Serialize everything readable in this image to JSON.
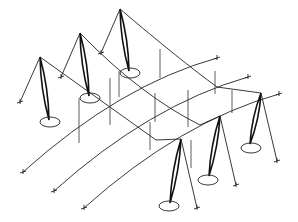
{
  "diagram": {
    "type": "cable-net tensile structure (isometric line drawing)",
    "stroke_color": "#222222",
    "background": "#ffffff",
    "masts": [
      {
        "id": "A",
        "tip": [
          40,
          57
        ],
        "foot": [
          49,
          120
        ],
        "base": [
          50,
          122,
          10,
          5
        ],
        "backstay": [
          20,
          102
        ],
        "forestay_mid": [
          61,
          77
        ]
      },
      {
        "id": "B",
        "tip": [
          80,
          33
        ],
        "foot": [
          89,
          96
        ],
        "base": [
          90,
          98,
          10,
          5
        ],
        "backstay": [
          61,
          77
        ],
        "forestay_mid": [
          101,
          53
        ]
      },
      {
        "id": "C",
        "tip": [
          120,
          9
        ],
        "foot": [
          129,
          71
        ],
        "base": [
          130,
          73,
          10,
          5
        ],
        "backstay": [
          101,
          53
        ]
      },
      {
        "id": "D",
        "tip": [
          181,
          139
        ],
        "foot": [
          170,
          203
        ],
        "base": [
          169,
          206,
          10,
          5
        ],
        "backstay": [
          197,
          208
        ]
      },
      {
        "id": "E",
        "tip": [
          220,
          116
        ],
        "foot": [
          209,
          176
        ],
        "base": [
          208,
          180,
          10,
          5
        ],
        "backstay": [
          236,
          185
        ]
      },
      {
        "id": "F",
        "tip": [
          261,
          93
        ],
        "foot": [
          250,
          144
        ],
        "base": [
          251,
          148,
          10,
          5
        ],
        "backstay": [
          277,
          161
        ]
      }
    ],
    "ridge_cables": [
      {
        "d": "M40 57 L156 140 L181 139"
      },
      {
        "d": "M80 33 Q140 95 200 125 L220 116"
      },
      {
        "d": "M120 9 Q180 60 217 87 L261 93"
      }
    ],
    "valley_cables": [
      {
        "d": "M23 172 Q120 85 217 58",
        "anchor": [
          217,
          58
        ]
      },
      {
        "d": "M54 191 Q150 105 248 77",
        "anchor": [
          248,
          77
        ]
      },
      {
        "d": "M84 208 Q180 122 279 94",
        "anchor": [
          279,
          94
        ]
      }
    ],
    "hangers": [
      {
        "x": 79,
        "y1": 98,
        "y2": 143
      },
      {
        "x": 110,
        "y1": 78,
        "y2": 125
      },
      {
        "x": 119,
        "y1": 71,
        "y2": 97
      },
      {
        "x": 160,
        "y1": 49,
        "y2": 78
      },
      {
        "x": 150,
        "y1": 122,
        "y2": 150
      },
      {
        "x": 188,
        "y1": 90,
        "y2": 127
      },
      {
        "x": 191,
        "y1": 140,
        "y2": 168
      },
      {
        "x": 215,
        "y1": 71,
        "y2": 94
      },
      {
        "x": 232,
        "y1": 90,
        "y2": 113
      },
      {
        "x": 155,
        "y1": 93,
        "y2": 122
      }
    ]
  }
}
